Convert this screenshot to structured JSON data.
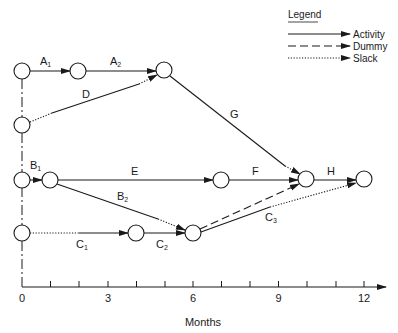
{
  "legend": {
    "title": "Legend",
    "items": [
      {
        "label": "Activity",
        "style": "solid"
      },
      {
        "label": "Dummy",
        "style": "dashed"
      },
      {
        "label": "Slack",
        "style": "dotted"
      }
    ]
  },
  "axis": {
    "label": "Months",
    "tick_labels": [
      "0",
      "3",
      "6",
      "9",
      "12"
    ],
    "min": 0,
    "max": 12,
    "minor_ticks": [
      1,
      2,
      3,
      4,
      5,
      6,
      7,
      8,
      9,
      10,
      11,
      12
    ]
  },
  "activities": {
    "A1": {
      "main": "A",
      "sub": "1"
    },
    "A2": {
      "main": "A",
      "sub": "2"
    },
    "D": {
      "main": "D",
      "sub": ""
    },
    "G": {
      "main": "G",
      "sub": ""
    },
    "B1": {
      "main": "B",
      "sub": "1"
    },
    "E": {
      "main": "E",
      "sub": ""
    },
    "F": {
      "main": "F",
      "sub": ""
    },
    "H": {
      "main": "H",
      "sub": ""
    },
    "B2": {
      "main": "B",
      "sub": "2"
    },
    "C1": {
      "main": "C",
      "sub": "1"
    },
    "C2": {
      "main": "C",
      "sub": "2"
    },
    "C3": {
      "main": "C",
      "sub": "3"
    }
  },
  "colors": {
    "ink": "#1a1a1a",
    "background": "#ffffff"
  }
}
